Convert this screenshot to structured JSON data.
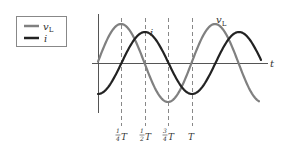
{
  "legend": {
    "items": [
      {
        "label": "v",
        "subscript": "L",
        "color": "#808080",
        "series": "voltage"
      },
      {
        "label": "i",
        "subscript": "",
        "color": "#222222",
        "series": "current"
      }
    ]
  },
  "axes": {
    "x_label": "t",
    "x_ticks": [
      {
        "num": "1",
        "den": "4",
        "sym": "T"
      },
      {
        "num": "1",
        "den": "2",
        "sym": "T"
      },
      {
        "num": "3",
        "den": "4",
        "sym": "T"
      },
      {
        "num": "",
        "den": "",
        "sym": "T"
      }
    ]
  },
  "curve_labels": {
    "voltage": {
      "text": "v",
      "sub": "L"
    },
    "current": {
      "text": "i"
    }
  },
  "colors": {
    "voltage": "#808080",
    "current": "#222222",
    "axis": "#555555",
    "dash": "#777777"
  },
  "chart_data": {
    "type": "line",
    "xlabel": "t",
    "ylabel": "",
    "x": [
      "0",
      "1/4 T",
      "1/2 T",
      "3/4 T",
      "T",
      "5/4 T",
      "3/2 T",
      "7/4 T"
    ],
    "series": [
      {
        "name": "v_L",
        "values": [
          0,
          1,
          0,
          -1,
          0,
          1,
          0,
          -1
        ]
      },
      {
        "name": "i",
        "values": [
          -0.8,
          0,
          0.8,
          0,
          -0.8,
          0,
          0.8,
          0
        ]
      }
    ],
    "grid": false,
    "legend_position": "upper-left"
  }
}
